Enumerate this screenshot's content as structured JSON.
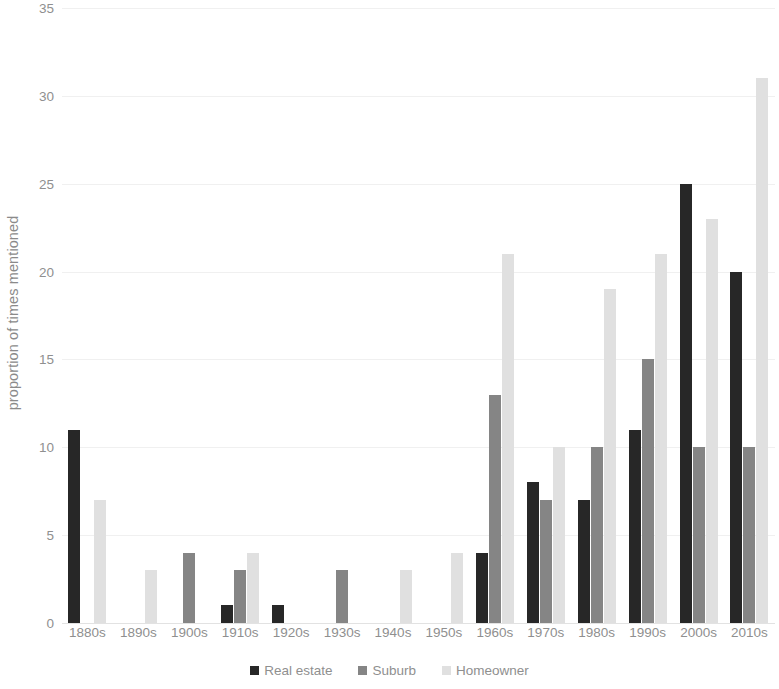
{
  "chart_data": {
    "type": "bar",
    "title": "",
    "xlabel": "",
    "ylabel": "proportion of times mentioned",
    "ylim": [
      0,
      35
    ],
    "ytick_labels": [
      "35",
      "30",
      "25",
      "20",
      "15",
      "10",
      "5",
      "0"
    ],
    "yticks": [
      35,
      30,
      25,
      20,
      15,
      10,
      5,
      0
    ],
    "grid": true,
    "legend_position": "bottom",
    "categories": [
      "1880s",
      "1890s",
      "1900s",
      "1910s",
      "1920s",
      "1930s",
      "1940s",
      "1950s",
      "1960s",
      "1970s",
      "1980s",
      "1990s",
      "2000s",
      "2010s"
    ],
    "series": [
      {
        "name": "Real estate",
        "color": "#272727",
        "values": [
          11,
          0,
          0,
          1,
          1,
          0,
          0,
          0,
          4,
          8,
          7,
          11,
          25,
          20
        ]
      },
      {
        "name": "Suburb",
        "color": "#858585",
        "values": [
          0,
          0,
          4,
          3,
          0,
          3,
          0,
          0,
          13,
          7,
          10,
          15,
          10,
          10
        ]
      },
      {
        "name": "Homeowner",
        "color": "#e0e0e0",
        "values": [
          7,
          3,
          0,
          4,
          0,
          0,
          3,
          4,
          21,
          10,
          19,
          21,
          23,
          31
        ]
      }
    ]
  },
  "colors": {
    "series_real_estate": "#272727",
    "series_suburb": "#858585",
    "series_homeowner": "#e0e0e0",
    "gridline": "#f0f0f0",
    "axis_text": "#8f8f8f",
    "background": "#ffffff"
  }
}
